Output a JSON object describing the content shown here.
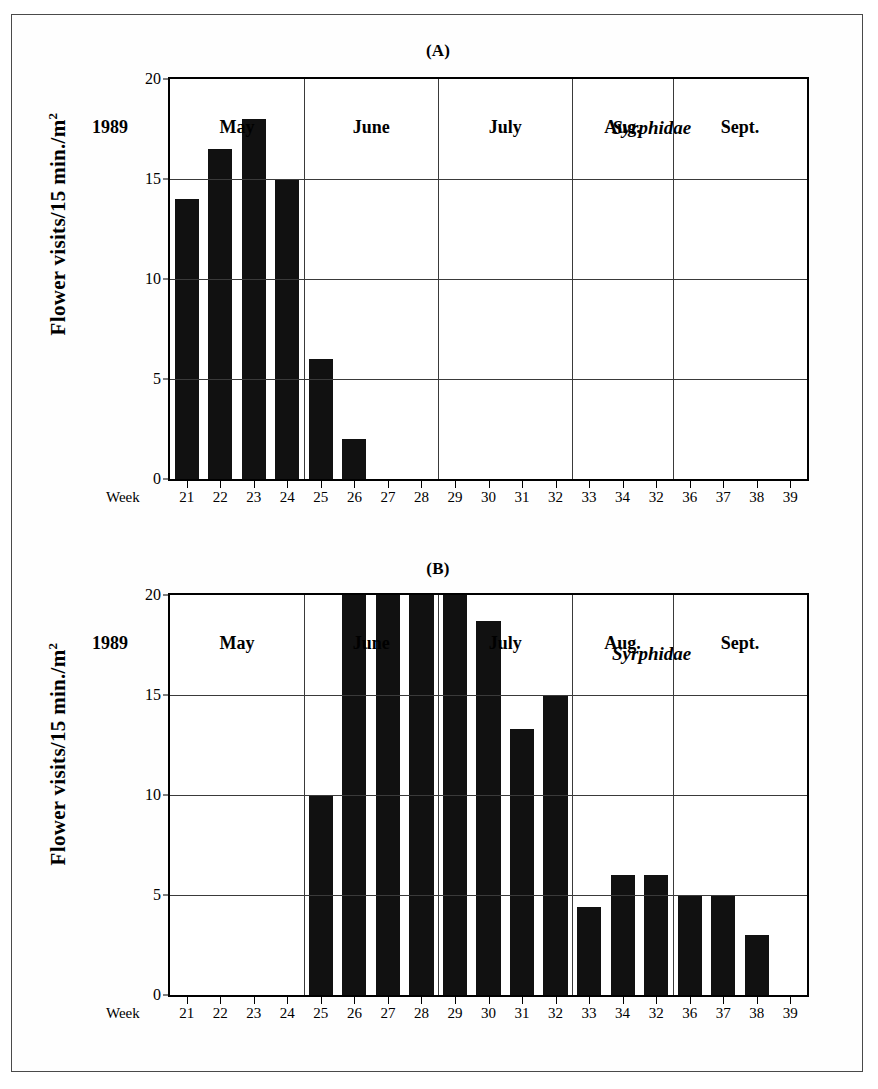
{
  "figure": {
    "background_color": "#ffffff",
    "bar_color": "#111111",
    "axis_color": "#000000",
    "grid_color": "#3a3a3a"
  },
  "panels": [
    {
      "label": "(A)",
      "ylabel_main": "Flower visits/15 min./m",
      "ylabel_sup": "2",
      "annotation": "Syrphidae",
      "year_label": "1989",
      "week_word": "Week"
    },
    {
      "label": "(B)",
      "ylabel_main": "Flower visits/15 min./m",
      "ylabel_sup": "2",
      "annotation": "Syrphidae",
      "year_label": "1989",
      "week_word": "Week"
    }
  ],
  "chart_data": [
    {
      "type": "bar",
      "title": "(A)",
      "xlabel": "Week",
      "ylabel": "Flower visits/15 min./m2",
      "ylim": [
        0,
        20
      ],
      "yticks": [
        0,
        5,
        10,
        15,
        20
      ],
      "ytick_labels": [
        "0",
        "5",
        "10",
        "15",
        "20"
      ],
      "grid": true,
      "grid_vertical_at_weeks": [
        25,
        29,
        33,
        36
      ],
      "annotation": "Syrphidae",
      "year": "1989",
      "categories": [
        "21",
        "22",
        "23",
        "24",
        "25",
        "26",
        "27",
        "28",
        "29",
        "30",
        "31",
        "32",
        "33",
        "34",
        "32",
        "36",
        "37",
        "38",
        "39"
      ],
      "values": [
        14,
        16.5,
        18,
        15,
        6,
        2,
        0,
        0,
        0,
        0,
        0,
        0,
        0,
        0,
        0,
        0,
        0,
        0,
        0
      ],
      "month_groups": [
        {
          "label": "May",
          "weeks": [
            "21",
            "22",
            "23",
            "24"
          ]
        },
        {
          "label": "June",
          "weeks": [
            "25",
            "26",
            "27",
            "28"
          ]
        },
        {
          "label": "July",
          "weeks": [
            "29",
            "30",
            "31",
            "32"
          ]
        },
        {
          "label": "Aug.",
          "weeks": [
            "33",
            "34",
            "32"
          ]
        },
        {
          "label": "Sept.",
          "weeks": [
            "36",
            "37",
            "38",
            "39"
          ]
        }
      ]
    },
    {
      "type": "bar",
      "title": "(B)",
      "xlabel": "Week",
      "ylabel": "Flower visits/15 min./m2",
      "ylim": [
        0,
        20
      ],
      "yticks": [
        0,
        5,
        10,
        15,
        20
      ],
      "ytick_labels": [
        "0",
        "5",
        "10",
        "15",
        "20"
      ],
      "grid": true,
      "grid_vertical_at_weeks": [
        25,
        29,
        33,
        36
      ],
      "annotation": "Syrphidae",
      "year": "1989",
      "categories": [
        "21",
        "22",
        "23",
        "24",
        "25",
        "26",
        "27",
        "28",
        "29",
        "30",
        "31",
        "32",
        "33",
        "34",
        "32",
        "36",
        "37",
        "38",
        "39"
      ],
      "values": [
        0,
        0,
        0,
        0,
        10,
        20,
        20,
        20,
        20,
        18.7,
        13.3,
        15,
        4.4,
        6,
        6,
        5,
        5,
        3,
        0
      ],
      "clipped_at_top": [
        "26",
        "27",
        "28",
        "29"
      ],
      "month_groups": [
        {
          "label": "May",
          "weeks": [
            "21",
            "22",
            "23",
            "24"
          ]
        },
        {
          "label": "June",
          "weeks": [
            "25",
            "26",
            "27",
            "28"
          ]
        },
        {
          "label": "July",
          "weeks": [
            "29",
            "30",
            "31",
            "32"
          ]
        },
        {
          "label": "Aug.",
          "weeks": [
            "33",
            "34",
            "32"
          ]
        },
        {
          "label": "Sept.",
          "weeks": [
            "36",
            "37",
            "38",
            "39"
          ]
        }
      ]
    }
  ]
}
